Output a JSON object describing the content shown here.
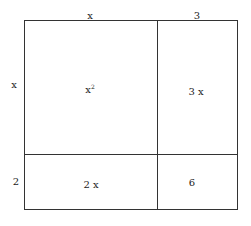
{
  "diagram": {
    "type": "area-model",
    "top_labels": [
      "x",
      "3"
    ],
    "side_labels": [
      "x",
      "2"
    ],
    "cells": [
      {
        "base": "x",
        "exp": "2"
      },
      {
        "base": "3 x",
        "exp": ""
      },
      {
        "base": "2 x",
        "exp": ""
      },
      {
        "base": "6",
        "exp": ""
      }
    ],
    "line_color": "#333333"
  }
}
